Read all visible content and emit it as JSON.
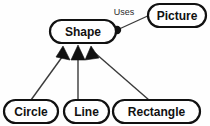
{
  "diagram": {
    "type": "class-diagram",
    "background_color": "#fefefe",
    "stroke_color": "#111111",
    "line_color": "#3a3a3a",
    "nodes": [
      {
        "id": "shape",
        "label": "Shape",
        "x": 50,
        "y": 20,
        "width": 66,
        "height": 23,
        "font_size": 12,
        "border_width": 2.2
      },
      {
        "id": "picture",
        "label": "Picture",
        "x": 148,
        "y": 4,
        "width": 58,
        "height": 23,
        "font_size": 12,
        "border_width": 2.2
      },
      {
        "id": "circle",
        "label": "Circle",
        "x": 4,
        "y": 100,
        "width": 54,
        "height": 23,
        "font_size": 12,
        "border_width": 2.2
      },
      {
        "id": "line",
        "label": "Line",
        "x": 64,
        "y": 100,
        "width": 45,
        "height": 23,
        "font_size": 12,
        "border_width": 2.2
      },
      {
        "id": "rectangle",
        "label": "Rectangle",
        "x": 113,
        "y": 100,
        "width": 87,
        "height": 23,
        "font_size": 12,
        "border_width": 2.2
      }
    ],
    "edges": [
      {
        "id": "circle-to-shape",
        "from": "circle",
        "to": "shape",
        "kind": "inheritance",
        "arrow": "solid-triangle",
        "path": "M 31 100 L 65 53",
        "arrow_points": "63,46 70,60 56,57",
        "stroke_width": 1.4
      },
      {
        "id": "line-to-shape",
        "from": "line",
        "to": "shape",
        "kind": "inheritance",
        "arrow": "solid-triangle",
        "path": "M 78 100 L 78 56",
        "arrow_points": "78,45 85,60 71,60",
        "stroke_width": 1.4
      },
      {
        "id": "rectangle-to-shape",
        "from": "rectangle",
        "to": "shape",
        "kind": "inheritance",
        "arrow": "solid-triangle",
        "path": "M 149 100 L 95 53",
        "arrow_points": "91,46 99,58 85,60",
        "stroke_width": 1.4
      },
      {
        "id": "shape-uses-picture",
        "from": "shape",
        "to": "picture",
        "kind": "association",
        "label": "Uses",
        "arrow": "filled-dot",
        "path": "M 117 30 L 152 14",
        "stroke_width": 1.3,
        "dot": {
          "cx": 117,
          "cy": 30,
          "r": 4.2
        },
        "label_x": 124,
        "label_y": 13,
        "label_font_size": 9
      }
    ]
  }
}
